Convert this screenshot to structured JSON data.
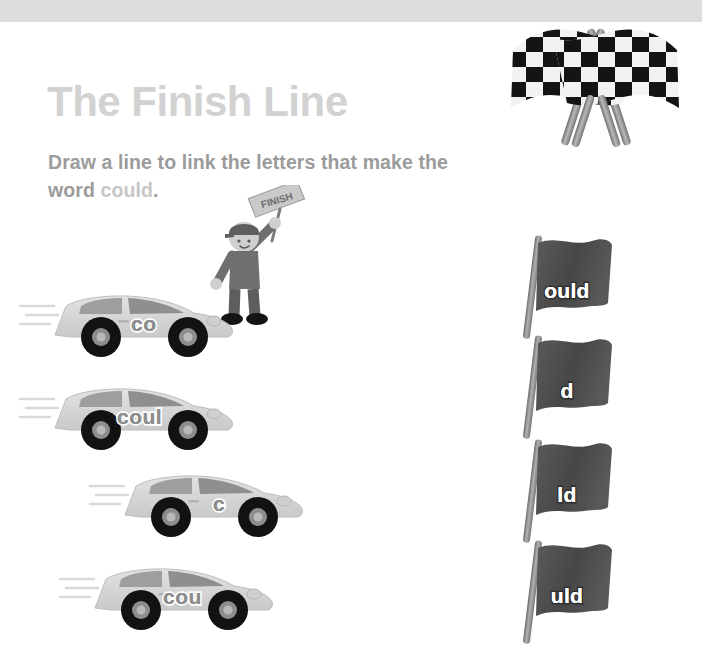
{
  "worksheet": {
    "title": "The Finish Line",
    "instruction_prefix": "Draw a line to link the letters that make the word ",
    "target_word": "could",
    "instruction_suffix": ".",
    "referee_flag_text": "FINISH"
  },
  "colors": {
    "top_band": "#dcdcdc",
    "title": "#d2d2d2",
    "instruction": "#9b9b9b",
    "target_word": "#c6c6c6",
    "car_body": "#d6d6d6",
    "car_label": "#8e8e8e",
    "flag_cloth": "#4a4a4a",
    "flag_pole": "#8c8c8c",
    "flag_label": "#ffffff",
    "tire": "#1a1a1a"
  },
  "cars": [
    {
      "id": "car-1",
      "label": "co"
    },
    {
      "id": "car-2",
      "label": "coul"
    },
    {
      "id": "car-3",
      "label": "c"
    },
    {
      "id": "car-4",
      "label": "cou"
    }
  ],
  "flags": [
    {
      "id": "flag-1",
      "label": "ould"
    },
    {
      "id": "flag-2",
      "label": "d"
    },
    {
      "id": "flag-3",
      "label": "ld"
    },
    {
      "id": "flag-4",
      "label": "uld"
    }
  ],
  "icons": {
    "checkered_flags": "crossed-checkered-racing-flags-icon",
    "referee": "race-marshal-with-finish-flag-icon",
    "car": "race-car-icon",
    "flag": "waving-flag-on-pole-icon",
    "speed_lines": "speed-lines-icon"
  }
}
